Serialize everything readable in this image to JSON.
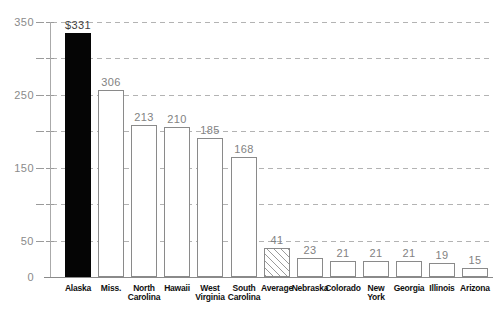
{
  "header": {
    "title_fragment": "Pork per Capita, 2007"
  },
  "colors": {
    "background": "#ffffff",
    "bar_fill": "#ffffff",
    "bar_border": "#8a8a8a",
    "highlight_fill": "#050505",
    "hatch_stroke": "#9a9a9a",
    "grid": "#b3b3b3",
    "axis": "#8a8a8a",
    "value_label": "#828282",
    "category_label": "#101010"
  },
  "chart_data": {
    "type": "bar",
    "title": "Pork per Capita, 2007",
    "title_note": "title mostly cropped out of frame at top of screenshot",
    "categories": [
      "Alaska",
      "Miss.",
      "North\nCarolina",
      "Hawaii",
      "West\nVirginia",
      "South\nCarolina",
      "Average",
      "Nebraska",
      "Colorado",
      "New\nYork",
      "Georgia",
      "Illinois",
      "Arizona"
    ],
    "values": [
      331,
      306,
      213,
      210,
      185,
      168,
      41,
      23,
      21,
      21,
      21,
      19,
      15
    ],
    "value_labels": [
      "$331",
      "306",
      "213",
      "210",
      "185",
      "168",
      "41",
      "23",
      "21",
      "21",
      "21",
      "19",
      "15"
    ],
    "highlight_index": 0,
    "hatched_index": 6,
    "xlabel": "",
    "ylabel": "",
    "ylim": [
      0,
      350
    ],
    "ytick_label_values": [
      0,
      50,
      150,
      250,
      350
    ],
    "gridline_step": 50,
    "grid_style": "dashed",
    "legend": "none",
    "bar_tops_px": [
      33,
      90,
      125,
      127,
      138,
      157,
      248,
      258,
      261,
      261,
      261,
      263,
      268
    ]
  }
}
